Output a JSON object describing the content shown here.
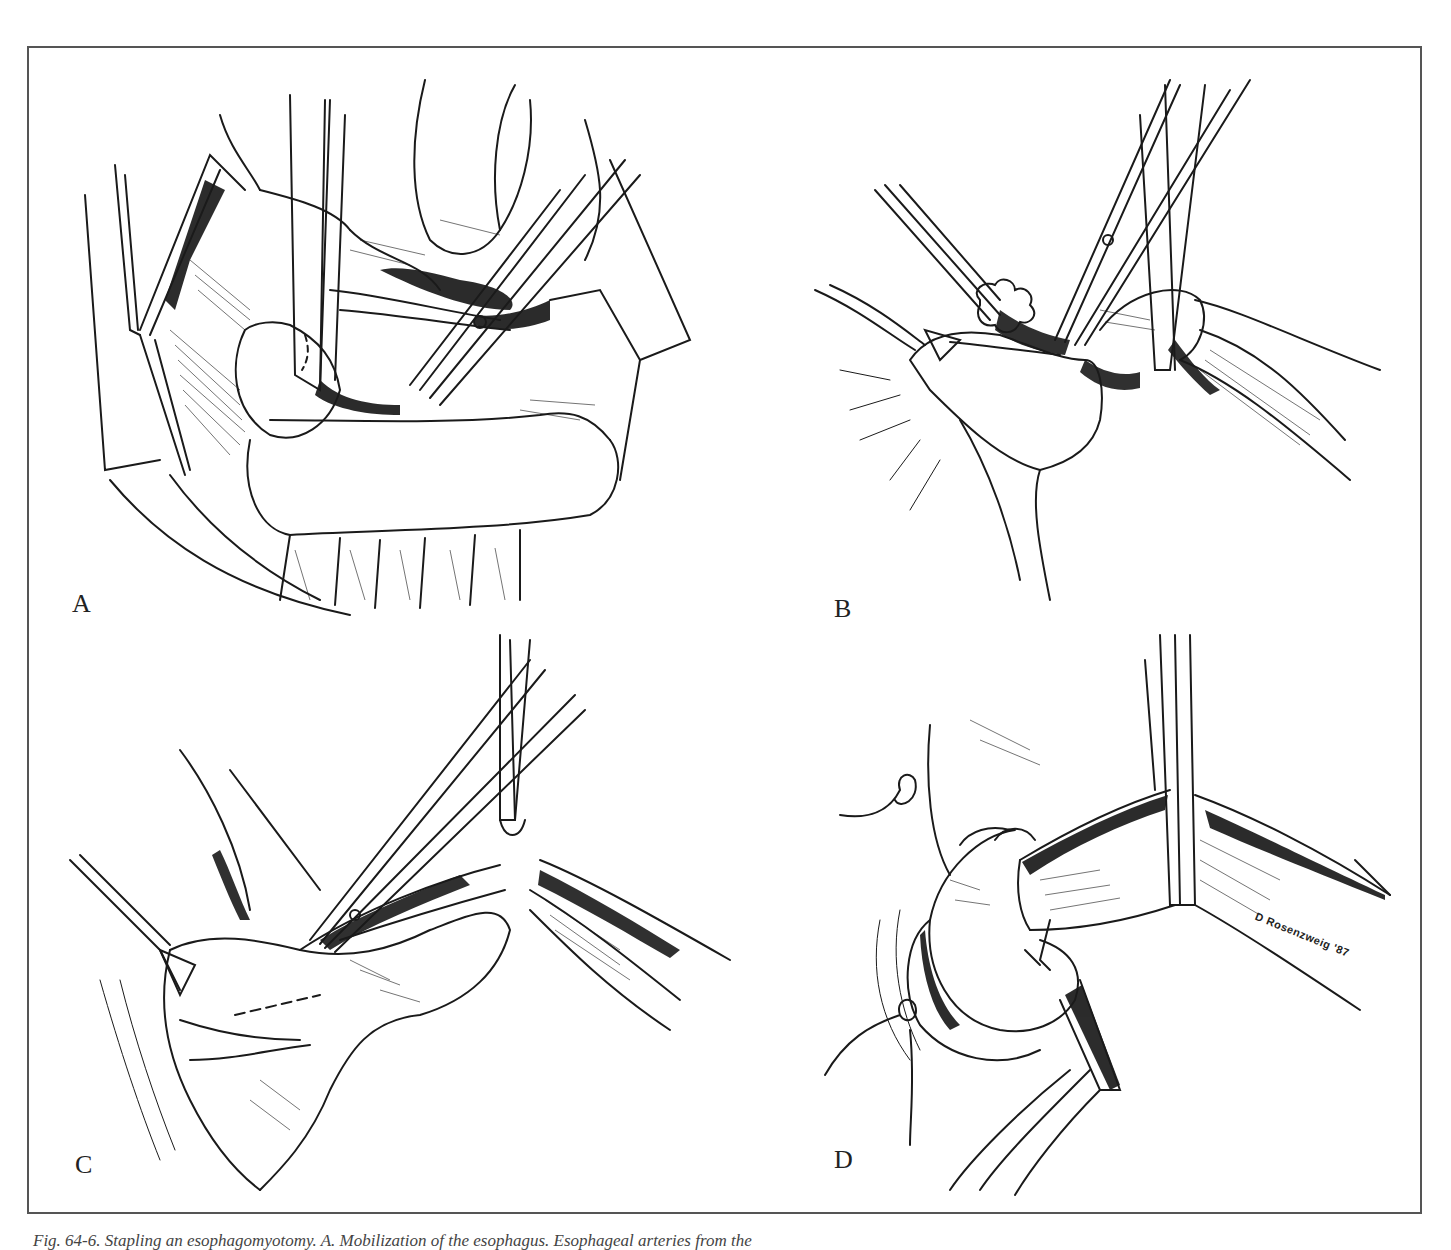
{
  "figure": {
    "panels": [
      {
        "id": "A",
        "label": "A",
        "description": "Mobilization of the esophagus through retracted operative field; retractors, clamp and scissors dividing esophageal arteries"
      },
      {
        "id": "B",
        "label": "B",
        "description": "Esophagus encircled with tape, scissors dissecting periesophageal tissue at gastroesophageal junction"
      },
      {
        "id": "C",
        "label": "C",
        "description": "Myotomy incision with instrument along the esophagus, dashed line marking extension onto stomach"
      },
      {
        "id": "D",
        "label": "D",
        "description": "Completed myotomy with sutures placed; signed by illustrator"
      }
    ],
    "signature": "D Rosenzweig '87",
    "caption": "Fig. 64-6. Stapling an esophagomyotomy. A. Mobilization of the esophagus. Esophageal arteries from the"
  },
  "colors": {
    "ink": "#1a1a1a",
    "frame": "#555555",
    "paper": "#ffffff",
    "caption": "#444444"
  }
}
